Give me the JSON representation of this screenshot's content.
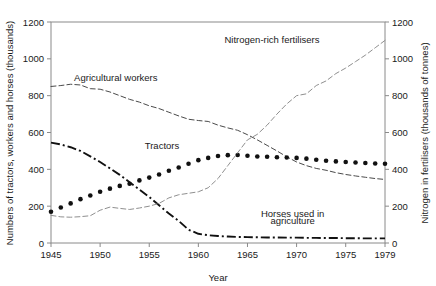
{
  "chart_data": {
    "type": "line",
    "title": "",
    "xlabel": "Year",
    "ylabel": "Numbers of tractors, workers and horses (thousands)",
    "ylabel_right": "Nitrogen in fertilisers (thousands of tonnes)",
    "xlim": [
      1945,
      1979
    ],
    "ylim": [
      0,
      1200
    ],
    "ylim_right": [
      0,
      1200
    ],
    "grid": false,
    "legend": "inline-annotations",
    "xticks": [
      "1945",
      "1950",
      "1955",
      "1960",
      "1965",
      "1970",
      "1975",
      "1979"
    ],
    "xtick_values": [
      1945,
      1950,
      1955,
      1960,
      1965,
      1970,
      1975,
      1979
    ],
    "yticks": [
      "0",
      "200",
      "400",
      "600",
      "800",
      "1000",
      "1200"
    ],
    "ytick_values": [
      0,
      200,
      400,
      600,
      800,
      1000,
      1200
    ],
    "yticks_right": [
      "0",
      "200",
      "400",
      "600",
      "800",
      "1000",
      "1200"
    ],
    "ytick_values_right": [
      0,
      200,
      400,
      600,
      800,
      1000,
      1200
    ],
    "x": [
      1945,
      1946,
      1947,
      1948,
      1949,
      1950,
      1951,
      1952,
      1953,
      1954,
      1955,
      1956,
      1957,
      1958,
      1959,
      1960,
      1961,
      1962,
      1963,
      1964,
      1965,
      1966,
      1967,
      1968,
      1969,
      1970,
      1971,
      1972,
      1973,
      1974,
      1975,
      1976,
      1977,
      1978,
      1979
    ],
    "series": [
      {
        "name": "Agricultural workers",
        "axis": "left",
        "style": "dashed",
        "label_x": 1949,
        "label_y": 880,
        "values": [
          850,
          855,
          862,
          858,
          838,
          835,
          820,
          800,
          780,
          765,
          745,
          730,
          710,
          690,
          672,
          665,
          660,
          640,
          625,
          612,
          588,
          560,
          530,
          500,
          468,
          440,
          420,
          405,
          395,
          382,
          372,
          364,
          357,
          350,
          345
        ]
      },
      {
        "name": "Tractors",
        "axis": "left",
        "style": "dotted",
        "label_x": 1956,
        "label_y": 510,
        "values": [
          170,
          193,
          215,
          238,
          258,
          278,
          295,
          310,
          322,
          340,
          355,
          372,
          392,
          410,
          430,
          450,
          462,
          472,
          477,
          478,
          474,
          470,
          468,
          466,
          464,
          462,
          458,
          452,
          447,
          443,
          440,
          437,
          434,
          432,
          430
        ]
      },
      {
        "name": "Horses used in agriculture",
        "axis": "left",
        "style": "dash-dot",
        "label_x": 1967,
        "label_y": 130,
        "values": [
          545,
          535,
          520,
          500,
          470,
          440,
          405,
          370,
          330,
          290,
          250,
          205,
          160,
          120,
          72,
          50,
          42,
          38,
          35,
          33,
          32,
          31,
          30,
          30,
          29,
          29,
          28,
          28,
          27,
          27,
          26,
          26,
          25,
          25,
          25
        ]
      },
      {
        "name": "Nitrogen-rich fertilisers",
        "axis": "right",
        "style": "dashed-light",
        "label_x": 1967,
        "label_y": 1085,
        "values": [
          150,
          142,
          140,
          143,
          148,
          178,
          195,
          188,
          182,
          190,
          200,
          215,
          245,
          262,
          270,
          278,
          300,
          350,
          420,
          490,
          560,
          590,
          640,
          700,
          755,
          800,
          810,
          855,
          880,
          920,
          950,
          985,
          1020,
          1060,
          1100
        ]
      }
    ],
    "series_labels": {
      "workers": "Agricultural workers",
      "tractors": "Tractors",
      "horses_line1": "Horses used in",
      "horses_line2": "agriculture",
      "fertilisers": "Nitrogen-rich fertilisers"
    },
    "colors": {
      "workers": "#4a4a4a",
      "tractors": "#111111",
      "horses": "#111111",
      "fertilisers": "#8f8f8f",
      "axis": "#8a8a8a",
      "text": "#1a1a1a",
      "background": "#ffffff"
    }
  }
}
